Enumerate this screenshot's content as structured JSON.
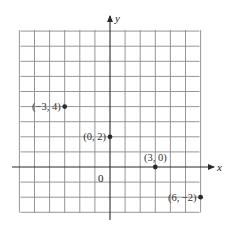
{
  "chart_data": {
    "type": "scatter",
    "title": "",
    "xlabel": "x",
    "ylabel": "y",
    "origin_label": "0",
    "xlim": [
      -6,
      6
    ],
    "ylim": [
      -3,
      9
    ],
    "grid": true,
    "grid_step": 1,
    "points": [
      {
        "x": -3,
        "y": 4,
        "label": "(−3, 4)",
        "label_side": "left"
      },
      {
        "x": 0,
        "y": 2,
        "label": "(0, 2)",
        "label_side": "left"
      },
      {
        "x": 3,
        "y": 0,
        "label": "(3, 0)",
        "label_side": "above"
      },
      {
        "x": 6,
        "y": -2,
        "label": "(6, −2)",
        "label_side": "left"
      }
    ],
    "colors": {
      "grid": "#8a8a8a",
      "axis": "#2a2a2a",
      "point": "#2a2a2a",
      "text": "#333333"
    }
  },
  "layout": {
    "origin_px": [
      110,
      167
    ],
    "unit_px": 15.1,
    "grid_px": {
      "left": 20.5,
      "right": 199.5,
      "top": 30,
      "bottom": 212.5
    },
    "x_axis_px": {
      "start": 12,
      "end": 214
    },
    "y_axis_px": {
      "start": 220,
      "end": 16
    }
  }
}
